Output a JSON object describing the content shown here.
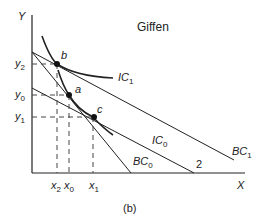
{
  "title": "Giffen",
  "caption": "(b)",
  "axes": {
    "y_label": "Y",
    "x_label": "X"
  },
  "y_ticks": [
    {
      "base": "y",
      "sub": "2"
    },
    {
      "base": "y",
      "sub": "0"
    },
    {
      "base": "y",
      "sub": "1"
    }
  ],
  "x_ticks": [
    {
      "base": "x",
      "sub": "2"
    },
    {
      "base": "x",
      "sub": "0"
    },
    {
      "base": "x",
      "sub": "1"
    }
  ],
  "points": {
    "b": "b",
    "a": "a",
    "c": "c"
  },
  "curves": {
    "ic1": {
      "base": "IC",
      "sub": "1"
    },
    "ic0": {
      "base": "IC",
      "sub": "0"
    },
    "bc0": {
      "base": "BC",
      "sub": "0"
    },
    "bc1": {
      "base": "BC",
      "sub": "1"
    },
    "line2": "2"
  },
  "colors": {
    "line": "#222222",
    "dashed": "#444444"
  }
}
